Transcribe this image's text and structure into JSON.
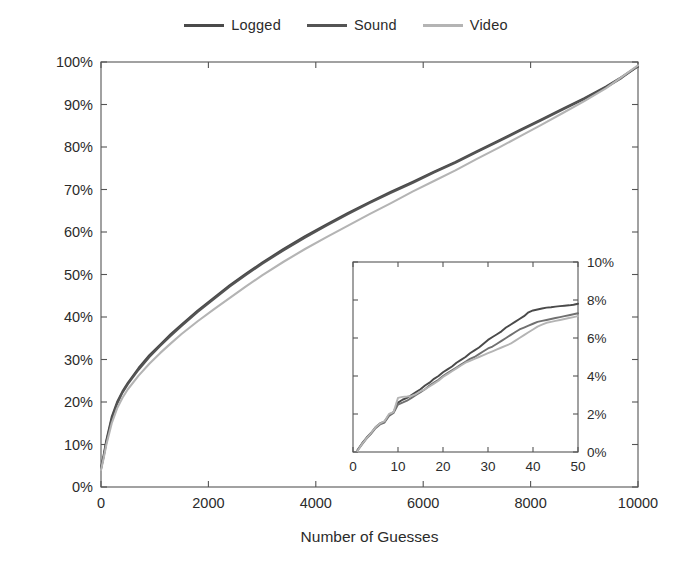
{
  "chart_data": {
    "type": "line",
    "title": "",
    "xlabel": "Number of Guesses",
    "ylabel": "PINs Recovered",
    "xlim": [
      0,
      10000
    ],
    "ylim": [
      0,
      100
    ],
    "grid": false,
    "legend_position": "top-center",
    "xticks": [
      0,
      2000,
      4000,
      6000,
      8000,
      10000
    ],
    "xtick_labels": [
      "0",
      "2000",
      "4000",
      "6000",
      "8000",
      "10000"
    ],
    "yticks": [
      0,
      10,
      20,
      30,
      40,
      50,
      60,
      70,
      80,
      90,
      100
    ],
    "ytick_labels": [
      "0%",
      "10%",
      "20%",
      "30%",
      "40%",
      "50%",
      "60%",
      "70%",
      "80%",
      "90%",
      "100%"
    ],
    "series": [
      {
        "name": "Logged",
        "color": "#4a4a4a",
        "x": [
          0,
          50,
          100,
          200,
          300,
          400,
          500,
          700,
          900,
          1100,
          1300,
          1500,
          1800,
          2100,
          2400,
          2700,
          3000,
          3400,
          3800,
          4200,
          4600,
          5000,
          5400,
          5800,
          6200,
          6600,
          7000,
          7400,
          7800,
          8200,
          8600,
          9000,
          9400,
          9700,
          10000
        ],
        "y": [
          4.5,
          7.5,
          11.0,
          16.5,
          20.0,
          22.5,
          24.5,
          28.0,
          31.0,
          33.5,
          36.0,
          38.2,
          41.5,
          44.5,
          47.5,
          50.2,
          52.8,
          56.0,
          59.0,
          61.8,
          64.5,
          67.0,
          69.5,
          71.8,
          74.2,
          76.5,
          79.0,
          81.5,
          84.0,
          86.5,
          89.0,
          91.5,
          94.2,
          96.5,
          99.0
        ]
      },
      {
        "name": "Sound",
        "color": "#545454",
        "x": [
          0,
          50,
          100,
          200,
          300,
          400,
          500,
          700,
          900,
          1100,
          1300,
          1500,
          1800,
          2100,
          2400,
          2700,
          3000,
          3400,
          3800,
          4200,
          4600,
          5000,
          5400,
          5800,
          6200,
          6600,
          7000,
          7400,
          7800,
          8200,
          8600,
          9000,
          9400,
          9700,
          10000
        ],
        "y": [
          4.2,
          7.2,
          10.6,
          16.0,
          19.6,
          22.2,
          24.2,
          27.6,
          30.6,
          33.2,
          35.6,
          37.9,
          41.2,
          44.2,
          47.2,
          49.9,
          52.5,
          55.7,
          58.7,
          61.5,
          64.2,
          66.8,
          69.2,
          71.5,
          74.0,
          76.3,
          78.8,
          81.3,
          83.8,
          86.3,
          88.8,
          91.3,
          94.0,
          96.3,
          99.0
        ]
      },
      {
        "name": "Video",
        "color": "#b4b4b4",
        "x": [
          0,
          50,
          100,
          200,
          300,
          400,
          500,
          700,
          900,
          1100,
          1300,
          1500,
          1800,
          2100,
          2400,
          2700,
          3000,
          3400,
          3800,
          4200,
          4600,
          5000,
          5400,
          5800,
          6200,
          6600,
          7000,
          7400,
          7800,
          8200,
          8600,
          9000,
          9400,
          9700,
          10000
        ],
        "y": [
          4.0,
          6.8,
          10.0,
          15.0,
          18.5,
          21.0,
          23.0,
          26.2,
          29.0,
          31.5,
          33.8,
          36.0,
          39.0,
          41.8,
          44.5,
          47.2,
          49.8,
          53.0,
          56.0,
          58.8,
          61.5,
          64.2,
          66.8,
          69.5,
          72.0,
          74.5,
          77.2,
          79.8,
          82.5,
          85.2,
          88.0,
          90.8,
          93.8,
          96.5,
          99.2
        ]
      }
    ],
    "inset": {
      "type": "line",
      "xlim": [
        0,
        50
      ],
      "ylim": [
        0,
        10
      ],
      "grid": false,
      "xticks": [
        0,
        10,
        20,
        30,
        40,
        50
      ],
      "xtick_labels": [
        "0",
        "10",
        "20",
        "30",
        "40",
        "50"
      ],
      "yticks": [
        0,
        2,
        4,
        6,
        8,
        10
      ],
      "ytick_labels": [
        "0%",
        "2%",
        "4%",
        "6%",
        "8%",
        "10%"
      ],
      "yaxis_side": "right",
      "series": [
        {
          "name": "Logged",
          "color": "#4a4a4a",
          "x": [
            1,
            2,
            3,
            4,
            5,
            6,
            7,
            8,
            9,
            10,
            11,
            12,
            13,
            14,
            15,
            16,
            17,
            18,
            19,
            20,
            21,
            22,
            23,
            24,
            25,
            26,
            27,
            28,
            29,
            30,
            31,
            32,
            33,
            34,
            35,
            36,
            37,
            38,
            39,
            40,
            41,
            42,
            43,
            44,
            45,
            46,
            47,
            48,
            49,
            50
          ],
          "y": [
            0.1,
            0.45,
            0.75,
            1.0,
            1.3,
            1.5,
            1.6,
            1.95,
            2.1,
            2.6,
            2.75,
            2.85,
            3.0,
            3.15,
            3.3,
            3.5,
            3.65,
            3.85,
            4.0,
            4.2,
            4.35,
            4.5,
            4.7,
            4.85,
            5.0,
            5.2,
            5.35,
            5.5,
            5.7,
            5.9,
            6.05,
            6.2,
            6.35,
            6.55,
            6.7,
            6.85,
            7.0,
            7.15,
            7.35,
            7.45,
            7.5,
            7.55,
            7.6,
            7.62,
            7.65,
            7.68,
            7.7,
            7.72,
            7.75,
            7.8
          ]
        },
        {
          "name": "Sound",
          "color": "#707070",
          "x": [
            1,
            2,
            3,
            4,
            5,
            6,
            7,
            8,
            9,
            10,
            11,
            12,
            13,
            14,
            15,
            16,
            17,
            18,
            19,
            20,
            21,
            22,
            23,
            24,
            25,
            26,
            27,
            28,
            29,
            30,
            31,
            32,
            33,
            34,
            35,
            36,
            37,
            38,
            39,
            40,
            41,
            42,
            43,
            44,
            45,
            46,
            47,
            48,
            49,
            50
          ],
          "y": [
            0.08,
            0.4,
            0.7,
            0.95,
            1.25,
            1.45,
            1.55,
            1.9,
            2.05,
            2.5,
            2.6,
            2.7,
            2.85,
            3.0,
            3.15,
            3.3,
            3.5,
            3.65,
            3.8,
            4.0,
            4.15,
            4.3,
            4.45,
            4.6,
            4.75,
            4.9,
            5.0,
            5.15,
            5.3,
            5.45,
            5.55,
            5.7,
            5.85,
            6.0,
            6.15,
            6.3,
            6.45,
            6.55,
            6.65,
            6.75,
            6.85,
            6.9,
            6.95,
            7.0,
            7.05,
            7.1,
            7.15,
            7.2,
            7.25,
            7.3
          ]
        },
        {
          "name": "Video",
          "color": "#b4b4b4",
          "x": [
            1,
            2,
            3,
            4,
            5,
            6,
            7,
            8,
            9,
            10,
            11,
            12,
            13,
            14,
            15,
            16,
            17,
            18,
            19,
            20,
            21,
            22,
            23,
            24,
            25,
            26,
            27,
            28,
            29,
            30,
            31,
            32,
            33,
            34,
            35,
            36,
            37,
            38,
            39,
            40,
            41,
            42,
            43,
            44,
            45,
            46,
            47,
            48,
            49,
            50
          ],
          "y": [
            0.05,
            0.42,
            0.72,
            1.0,
            1.3,
            1.5,
            1.62,
            2.0,
            2.1,
            2.85,
            2.9,
            2.92,
            2.95,
            3.05,
            3.2,
            3.3,
            3.45,
            3.6,
            3.75,
            3.95,
            4.1,
            4.25,
            4.4,
            4.55,
            4.7,
            4.8,
            4.9,
            5.0,
            5.1,
            5.2,
            5.3,
            5.4,
            5.5,
            5.6,
            5.7,
            5.85,
            6.0,
            6.15,
            6.3,
            6.45,
            6.6,
            6.7,
            6.8,
            6.85,
            6.9,
            6.95,
            7.0,
            7.05,
            7.1,
            7.15
          ]
        }
      ]
    }
  },
  "legend": {
    "items": [
      {
        "label": "Logged",
        "color": "#4a4a4a"
      },
      {
        "label": "Sound",
        "color": "#545454"
      },
      {
        "label": "Video",
        "color": "#b4b4b4"
      }
    ]
  },
  "axes": {
    "x_title": "Number of Guesses",
    "y_title": "PINs Recovered"
  }
}
